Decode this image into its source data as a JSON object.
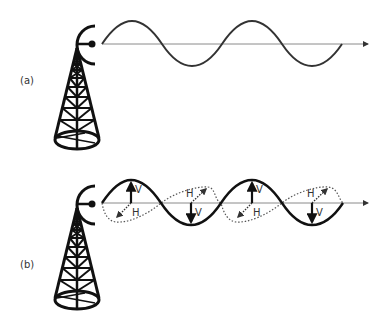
{
  "figure": {
    "panels": [
      {
        "id": "a",
        "label": "(a)",
        "description": "Radio tower emitting a single linearly polarized sine wave",
        "waves": [
          "single sine wave"
        ]
      },
      {
        "id": "b",
        "label": "(b)",
        "description": "Radio tower emitting vertically (solid) and horizontally (dotted, in perspective) polarized components",
        "arrow_labels": {
          "vertical": "V",
          "horizontal": "H"
        },
        "waves": [
          "vertical component (solid)",
          "horizontal component (dotted)"
        ]
      }
    ],
    "colors": {
      "ink": "#111111",
      "axis": "#8a8a8a",
      "label": "#333333",
      "dotted": "#555555"
    }
  }
}
